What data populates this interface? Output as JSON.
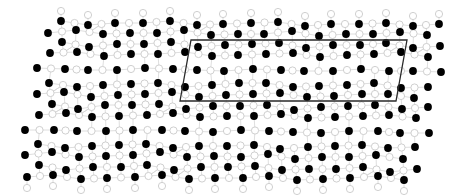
{
  "figure": {
    "width": 462,
    "height": 196,
    "background": "#ffffff"
  },
  "style": {
    "black_atom_fill": "#000000",
    "black_atom_radius": 3.9,
    "white_atom_fill": "#ffffff",
    "white_atom_stroke": "#c9c9c9",
    "white_atom_radius": 3.6,
    "bond_color": "#d6d6d6",
    "bond_width": 0.8,
    "bond_max_length": 15,
    "cell_stroke": "#2a2a2a",
    "cell_width": 1.3
  },
  "unit_cell": {
    "points": [
      [
        191,
        40
      ],
      [
        407,
        40
      ],
      [
        396,
        101
      ],
      [
        180,
        101
      ]
    ]
  },
  "white_atom_rule": {
    "midpoints_between_row_neighbors": true,
    "cap_above_first_row_dy": -10,
    "cap_below_last_row_dy": 11
  },
  "black_atom_rows": [
    [
      [
        61,
        21
      ],
      [
        88,
        25
      ],
      [
        115,
        23
      ],
      [
        143,
        23
      ],
      [
        170,
        21
      ],
      [
        197,
        25
      ],
      [
        223,
        24
      ],
      [
        251,
        23
      ],
      [
        278,
        22
      ],
      [
        305,
        26
      ],
      [
        331,
        24
      ],
      [
        359,
        24
      ],
      [
        386,
        23
      ],
      [
        413,
        26
      ],
      [
        439,
        24
      ]
    ],
    [
      [
        48,
        33
      ],
      [
        76,
        30
      ],
      [
        103,
        34
      ],
      [
        130,
        33
      ],
      [
        157,
        33
      ],
      [
        184,
        30
      ],
      [
        211,
        35
      ],
      [
        238,
        34
      ],
      [
        264,
        34
      ],
      [
        292,
        31
      ],
      [
        319,
        36
      ],
      [
        346,
        34
      ],
      [
        373,
        34
      ],
      [
        400,
        32
      ],
      [
        427,
        35
      ]
    ],
    [
      [
        62,
        42
      ],
      [
        89,
        47
      ],
      [
        117,
        44
      ],
      [
        144,
        44
      ],
      [
        171,
        42
      ],
      [
        198,
        47
      ],
      [
        225,
        45
      ],
      [
        252,
        44
      ],
      [
        279,
        43
      ],
      [
        306,
        48
      ],
      [
        333,
        45
      ],
      [
        360,
        45
      ],
      [
        386,
        43
      ],
      [
        413,
        48
      ],
      [
        440,
        46
      ]
    ],
    [
      [
        50,
        53
      ],
      [
        77,
        52
      ],
      [
        104,
        56
      ],
      [
        131,
        54
      ],
      [
        158,
        54
      ],
      [
        185,
        52
      ],
      [
        212,
        56
      ],
      [
        238,
        55
      ],
      [
        266,
        54
      ],
      [
        293,
        53
      ],
      [
        320,
        57
      ],
      [
        347,
        55
      ],
      [
        374,
        54
      ],
      [
        401,
        52
      ],
      [
        428,
        57
      ]
    ],
    [
      [
        37,
        68
      ],
      [
        65,
        69
      ],
      [
        88,
        70
      ],
      [
        117,
        70
      ],
      [
        145,
        68
      ],
      [
        173,
        69
      ],
      [
        197,
        70
      ],
      [
        224,
        71
      ],
      [
        253,
        69
      ],
      [
        281,
        70
      ],
      [
        304,
        71
      ],
      [
        333,
        71
      ],
      [
        361,
        69
      ],
      [
        389,
        71
      ],
      [
        413,
        71
      ],
      [
        441,
        72
      ]
    ],
    [
      [
        49,
        83
      ],
      [
        77,
        87
      ],
      [
        103,
        85
      ],
      [
        131,
        84
      ],
      [
        158,
        83
      ],
      [
        185,
        87
      ],
      [
        212,
        85
      ],
      [
        239,
        83
      ],
      [
        266,
        83
      ],
      [
        293,
        87
      ],
      [
        319,
        86
      ],
      [
        347,
        85
      ],
      [
        374,
        83
      ],
      [
        401,
        88
      ],
      [
        428,
        87
      ]
    ],
    [
      [
        37,
        94
      ],
      [
        64,
        92
      ],
      [
        91,
        97
      ],
      [
        118,
        95
      ],
      [
        145,
        94
      ],
      [
        172,
        92
      ],
      [
        199,
        97
      ],
      [
        226,
        95
      ],
      [
        253,
        94
      ],
      [
        280,
        93
      ],
      [
        307,
        97
      ],
      [
        334,
        96
      ],
      [
        362,
        94
      ],
      [
        388,
        94
      ],
      [
        414,
        98
      ]
    ],
    [
      [
        52,
        104
      ],
      [
        78,
        109
      ],
      [
        105,
        105
      ],
      [
        132,
        105
      ],
      [
        159,
        104
      ],
      [
        186,
        109
      ],
      [
        213,
        106
      ],
      [
        240,
        106
      ],
      [
        267,
        105
      ],
      [
        294,
        110
      ],
      [
        321,
        107
      ],
      [
        348,
        106
      ],
      [
        375,
        105
      ],
      [
        402,
        109
      ],
      [
        428,
        107
      ]
    ],
    [
      [
        39,
        115
      ],
      [
        66,
        113
      ],
      [
        92,
        117
      ],
      [
        119,
        116
      ],
      [
        147,
        115
      ],
      [
        173,
        113
      ],
      [
        200,
        117
      ],
      [
        227,
        116
      ],
      [
        254,
        116
      ],
      [
        281,
        114
      ],
      [
        308,
        118
      ],
      [
        335,
        117
      ],
      [
        363,
        116
      ],
      [
        389,
        115
      ],
      [
        416,
        118
      ]
    ],
    [
      [
        25,
        130
      ],
      [
        54,
        130
      ],
      [
        77,
        131
      ],
      [
        106,
        131
      ],
      [
        133,
        130
      ],
      [
        162,
        130
      ],
      [
        185,
        131
      ],
      [
        213,
        132
      ],
      [
        241,
        130
      ],
      [
        269,
        131
      ],
      [
        293,
        132
      ],
      [
        321,
        133
      ],
      [
        349,
        131
      ],
      [
        378,
        131
      ],
      [
        400,
        133
      ],
      [
        429,
        133
      ]
    ],
    [
      [
        38,
        144
      ],
      [
        65,
        148
      ],
      [
        92,
        146
      ],
      [
        119,
        145
      ],
      [
        146,
        144
      ],
      [
        173,
        148
      ],
      [
        199,
        146
      ],
      [
        227,
        146
      ],
      [
        254,
        145
      ],
      [
        280,
        149
      ],
      [
        308,
        147
      ],
      [
        335,
        146
      ],
      [
        362,
        145
      ],
      [
        388,
        148
      ],
      [
        415,
        147
      ]
    ],
    [
      [
        25,
        155
      ],
      [
        52,
        152
      ],
      [
        79,
        157
      ],
      [
        106,
        156
      ],
      [
        133,
        155
      ],
      [
        160,
        152
      ],
      [
        187,
        157
      ],
      [
        214,
        156
      ],
      [
        241,
        157
      ],
      [
        268,
        154
      ],
      [
        295,
        159
      ],
      [
        322,
        157
      ],
      [
        349,
        157
      ],
      [
        376,
        155
      ],
      [
        403,
        159
      ]
    ],
    [
      [
        39,
        165
      ],
      [
        66,
        170
      ],
      [
        93,
        167
      ],
      [
        121,
        167
      ],
      [
        147,
        165
      ],
      [
        174,
        170
      ],
      [
        201,
        167
      ],
      [
        228,
        167
      ],
      [
        255,
        166
      ],
      [
        282,
        170
      ],
      [
        309,
        169
      ],
      [
        336,
        169
      ],
      [
        363,
        167
      ],
      [
        390,
        172
      ],
      [
        417,
        169
      ]
    ],
    [
      [
        27,
        177
      ],
      [
        53,
        175
      ],
      [
        81,
        179
      ],
      [
        107,
        178
      ],
      [
        135,
        177
      ],
      [
        162,
        175
      ],
      [
        189,
        179
      ],
      [
        215,
        178
      ],
      [
        243,
        178
      ],
      [
        269,
        176
      ],
      [
        297,
        180
      ],
      [
        323,
        179
      ],
      [
        350,
        178
      ],
      [
        378,
        176
      ],
      [
        404,
        180
      ]
    ]
  ]
}
